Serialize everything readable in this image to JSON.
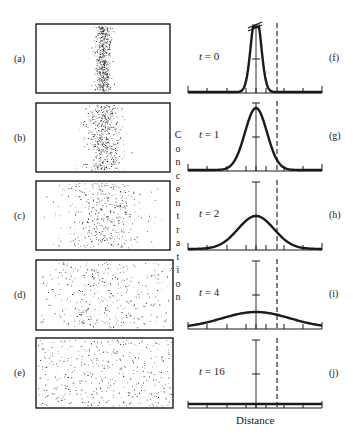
{
  "figure": {
    "y_axis_label": "Concentration",
    "x_axis_label": "Distance"
  },
  "particle_panels": [
    {
      "label": "(a)",
      "box": [
        36,
        24,
        170,
        93
      ],
      "spread": 4,
      "count": 520
    },
    {
      "label": "(b)",
      "box": [
        36,
        103,
        170,
        172
      ],
      "spread": 9,
      "count": 480
    },
    {
      "label": "(c)",
      "box": [
        36,
        181,
        170,
        250
      ],
      "spread": 20,
      "count": 420
    },
    {
      "label": "(d)",
      "box": [
        36,
        260,
        173,
        330
      ],
      "spread": 40,
      "count": 430
    },
    {
      "label": "(e)",
      "box": [
        36,
        338,
        173,
        408
      ],
      "spread": 0,
      "count": 420
    }
  ],
  "profile_panels": [
    {
      "label": "(f)",
      "time_prefix": "t",
      "time_value": "= 0",
      "baseline_y": 93,
      "peak_height": 80,
      "sigma": 5,
      "broken_peak": true
    },
    {
      "label": "(g)",
      "time_prefix": "t",
      "time_value": "= 1",
      "baseline_y": 171,
      "peak_height": 62,
      "sigma": 11,
      "broken_peak": false
    },
    {
      "label": "(h)",
      "time_prefix": "t",
      "time_value": "= 2",
      "baseline_y": 250,
      "peak_height": 33,
      "sigma": 18,
      "broken_peak": false
    },
    {
      "label": "(i)",
      "time_prefix": "t",
      "time_value": "= 4",
      "baseline_y": 329,
      "peak_height": 16,
      "sigma": 34,
      "broken_peak": false
    },
    {
      "label": "(j)",
      "time_prefix": "t",
      "time_value": "= 16",
      "baseline_y": 408,
      "peak_height": 3,
      "sigma": 400,
      "broken_peak": false
    }
  ],
  "axis": {
    "x_start": 188,
    "x_end": 322,
    "center_x": 256,
    "dashed_x": 277,
    "tick_xs": [
      188,
      207,
      227,
      246,
      256,
      266,
      284,
      303,
      322
    ],
    "colors": {
      "ink": "#1a1a1a",
      "dots": "#222222"
    }
  },
  "chart_data": {
    "type": "line",
    "xlabel": "Distance",
    "ylabel": "Concentration",
    "grid": false,
    "series": [
      {
        "name": "t = 0",
        "shape": "narrow spike (truncated peak)"
      },
      {
        "name": "t = 1",
        "shape": "narrow gaussian",
        "relative_peak": 0.78
      },
      {
        "name": "t = 2",
        "shape": "gaussian",
        "relative_peak": 0.41
      },
      {
        "name": "t = 4",
        "shape": "broad gaussian",
        "relative_peak": 0.2
      },
      {
        "name": "t = 16",
        "shape": "nearly uniform",
        "relative_peak": 0.04
      }
    ],
    "annotations": [
      "dashed vertical reference line right of center",
      "horizontal tick on concentration axis"
    ]
  }
}
